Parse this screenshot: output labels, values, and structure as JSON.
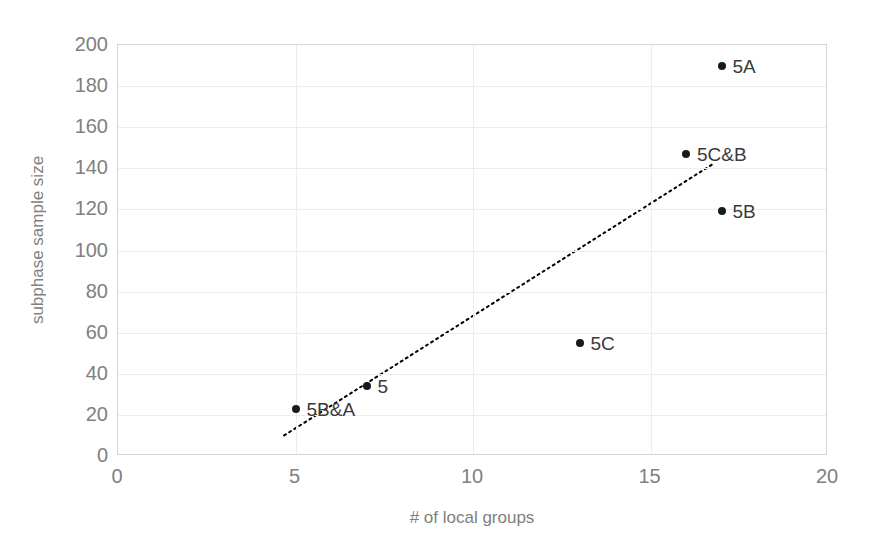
{
  "chart_data": {
    "type": "scatter",
    "title": "",
    "xlabel": "# of local groups",
    "ylabel": "subphase sample size",
    "xlim": [
      0,
      20
    ],
    "ylim": [
      0,
      200
    ],
    "xticks": [
      "0",
      "5",
      "10",
      "15",
      "20"
    ],
    "xtick_values": [
      0,
      5,
      10,
      15,
      20
    ],
    "yticks": [
      "0",
      "20",
      "40",
      "60",
      "80",
      "100",
      "120",
      "140",
      "160",
      "180",
      "200"
    ],
    "ytick_values": [
      0,
      20,
      40,
      60,
      80,
      100,
      120,
      140,
      160,
      180,
      200
    ],
    "grid": true,
    "grid_axis": "both",
    "legend": false,
    "series": [
      {
        "name": "subphase sample size",
        "marker": "circle",
        "color": "#1a1a1a",
        "points": [
          {
            "label": "5B&A",
            "x": 5,
            "y": 23,
            "label_position": "right"
          },
          {
            "label": "5",
            "x": 7,
            "y": 34,
            "label_position": "right"
          },
          {
            "label": "5C",
            "x": 13,
            "y": 55,
            "label_position": "right"
          },
          {
            "label": "5B",
            "x": 17,
            "y": 119,
            "label_position": "right"
          },
          {
            "label": "5C&B",
            "x": 16,
            "y": 147,
            "label_position": "right"
          },
          {
            "label": "5A",
            "x": 17,
            "y": 190,
            "label_position": "right"
          }
        ]
      }
    ],
    "trendline": {
      "style": "dotted",
      "color": "#000000",
      "x_start": 4.68,
      "y_start": 10,
      "x_end": 16.75,
      "y_end": 142
    },
    "annotations": []
  },
  "axis_titles": {
    "x": "# of local groups",
    "y": "subphase sample size"
  },
  "colors": {
    "marker": "#1a1a1a",
    "gridline": "#ededed",
    "plot_border": "#d6d6d6",
    "tick_label": "#808080",
    "axis_title": "#808080",
    "point_label": "#3a3a3a",
    "background": "#ffffff"
  }
}
